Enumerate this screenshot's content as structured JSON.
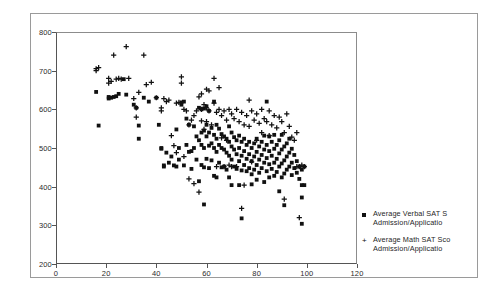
{
  "chart_data": {
    "type": "scatter",
    "title": "",
    "xlabel": "",
    "ylabel": "",
    "xlim": [
      0,
      120
    ],
    "ylim": [
      200,
      800
    ],
    "xticks": [
      0,
      20,
      40,
      60,
      80,
      100,
      120
    ],
    "yticks": [
      200,
      300,
      400,
      500,
      600,
      700,
      800
    ],
    "grid": false,
    "legend_position": "right",
    "series": [
      {
        "name": "Average Verbal SAT S Admission/Applicatio",
        "marker": "filled-square",
        "color": "#111111",
        "points": [
          [
            16,
            645
          ],
          [
            17,
            558
          ],
          [
            21,
            628
          ],
          [
            21,
            632
          ],
          [
            22,
            630
          ],
          [
            23,
            632
          ],
          [
            24,
            634
          ],
          [
            25,
            640
          ],
          [
            27,
            678
          ],
          [
            28,
            638
          ],
          [
            31,
            612
          ],
          [
            32,
            604
          ],
          [
            33,
            558
          ],
          [
            33,
            524
          ],
          [
            35,
            630
          ],
          [
            37,
            620
          ],
          [
            40,
            630
          ],
          [
            41,
            560
          ],
          [
            42,
            500
          ],
          [
            42,
            498
          ],
          [
            43,
            455
          ],
          [
            43,
            452
          ],
          [
            44,
            488
          ],
          [
            45,
            462
          ],
          [
            46,
            478
          ],
          [
            47,
            455
          ],
          [
            48,
            548
          ],
          [
            48,
            452
          ],
          [
            49,
            500
          ],
          [
            49,
            470
          ],
          [
            50,
            618
          ],
          [
            50,
            612
          ],
          [
            51,
            620
          ],
          [
            51,
            455
          ],
          [
            52,
            576
          ],
          [
            52,
            508
          ],
          [
            53,
            560
          ],
          [
            53,
            490
          ],
          [
            54,
            492
          ],
          [
            54,
            446
          ],
          [
            55,
            556
          ],
          [
            55,
            500
          ],
          [
            56,
            530
          ],
          [
            56,
            470
          ],
          [
            57,
            604
          ],
          [
            57,
            520
          ],
          [
            57,
            414
          ],
          [
            58,
            600
          ],
          [
            58,
            540
          ],
          [
            58,
            508
          ],
          [
            58,
            456
          ],
          [
            59,
            602
          ],
          [
            59,
            545
          ],
          [
            59,
            500
          ],
          [
            59,
            450
          ],
          [
            59,
            354
          ],
          [
            60,
            608
          ],
          [
            60,
            560
          ],
          [
            60,
            530
          ],
          [
            60,
            472
          ],
          [
            61,
            596
          ],
          [
            61,
            540
          ],
          [
            61,
            506
          ],
          [
            61,
            448
          ],
          [
            62,
            552
          ],
          [
            62,
            512
          ],
          [
            62,
            468
          ],
          [
            63,
            620
          ],
          [
            63,
            534
          ],
          [
            63,
            500
          ],
          [
            63,
            428
          ],
          [
            64,
            560
          ],
          [
            64,
            524
          ],
          [
            64,
            490
          ],
          [
            64,
            424
          ],
          [
            65,
            550
          ],
          [
            65,
            508
          ],
          [
            65,
            462
          ],
          [
            66,
            536
          ],
          [
            66,
            500
          ],
          [
            66,
            450
          ],
          [
            67,
            530
          ],
          [
            67,
            496
          ],
          [
            67,
            452
          ],
          [
            68,
            524
          ],
          [
            68,
            488
          ],
          [
            68,
            444
          ],
          [
            69,
            556
          ],
          [
            69,
            516
          ],
          [
            69,
            480
          ],
          [
            69,
            424
          ],
          [
            70,
            540
          ],
          [
            70,
            504
          ],
          [
            70,
            470
          ],
          [
            70,
            404
          ],
          [
            71,
            528
          ],
          [
            71,
            496
          ],
          [
            71,
            452
          ],
          [
            72,
            520
          ],
          [
            72,
            484
          ],
          [
            72,
            446
          ],
          [
            73,
            532
          ],
          [
            73,
            500
          ],
          [
            73,
            466
          ],
          [
            73,
            404
          ],
          [
            74,
            516
          ],
          [
            74,
            480
          ],
          [
            74,
            442
          ],
          [
            74,
            318
          ],
          [
            75,
            524
          ],
          [
            75,
            492
          ],
          [
            75,
            456
          ],
          [
            76,
            508
          ],
          [
            76,
            472
          ],
          [
            76,
            440
          ],
          [
            77,
            516
          ],
          [
            77,
            484
          ],
          [
            77,
            448
          ],
          [
            78,
            500
          ],
          [
            78,
            466
          ],
          [
            78,
            432
          ],
          [
            78,
            406
          ],
          [
            79,
            512
          ],
          [
            79,
            478
          ],
          [
            79,
            444
          ],
          [
            80,
            524
          ],
          [
            80,
            490
          ],
          [
            80,
            456
          ],
          [
            80,
            418
          ],
          [
            81,
            504
          ],
          [
            81,
            470
          ],
          [
            81,
            436
          ],
          [
            82,
            516
          ],
          [
            82,
            482
          ],
          [
            82,
            448
          ],
          [
            83,
            532
          ],
          [
            83,
            496
          ],
          [
            83,
            462
          ],
          [
            83,
            412
          ],
          [
            84,
            620
          ],
          [
            84,
            508
          ],
          [
            84,
            474
          ],
          [
            84,
            440
          ],
          [
            85,
            530
          ],
          [
            85,
            492
          ],
          [
            85,
            458
          ],
          [
            85,
            424
          ],
          [
            86,
            516
          ],
          [
            86,
            480
          ],
          [
            86,
            446
          ],
          [
            87,
            534
          ],
          [
            87,
            498
          ],
          [
            87,
            462
          ],
          [
            87,
            428
          ],
          [
            88,
            508
          ],
          [
            88,
            472
          ],
          [
            88,
            438
          ],
          [
            89,
            520
          ],
          [
            89,
            486
          ],
          [
            89,
            452
          ],
          [
            89,
            388
          ],
          [
            90,
            534
          ],
          [
            90,
            496
          ],
          [
            90,
            460
          ],
          [
            90,
            424
          ],
          [
            91,
            504
          ],
          [
            91,
            468
          ],
          [
            91,
            434
          ],
          [
            91,
            352
          ],
          [
            92,
            512
          ],
          [
            92,
            478
          ],
          [
            92,
            444
          ],
          [
            93,
            524
          ],
          [
            93,
            488
          ],
          [
            93,
            452
          ],
          [
            94,
            498
          ],
          [
            94,
            462
          ],
          [
            94,
            430
          ],
          [
            95,
            482
          ],
          [
            95,
            448
          ],
          [
            96,
            466
          ],
          [
            96,
            436
          ],
          [
            97,
            452
          ],
          [
            97,
            420
          ],
          [
            98,
            444
          ],
          [
            98,
            404
          ],
          [
            98,
            372
          ],
          [
            98,
            304
          ],
          [
            99,
            452
          ],
          [
            99,
            404
          ]
        ]
      },
      {
        "name": "Average Math SAT Sco Admission/Applicatio",
        "marker": "plus",
        "color": "#111111",
        "points": [
          [
            16,
            705
          ],
          [
            16,
            700
          ],
          [
            17,
            708
          ],
          [
            21,
            680
          ],
          [
            21,
            668
          ],
          [
            22,
            672
          ],
          [
            23,
            740
          ],
          [
            24,
            678
          ],
          [
            25,
            680
          ],
          [
            26,
            678
          ],
          [
            28,
            762
          ],
          [
            29,
            680
          ],
          [
            31,
            628
          ],
          [
            32,
            604
          ],
          [
            32,
            580
          ],
          [
            33,
            644
          ],
          [
            35,
            740
          ],
          [
            36,
            664
          ],
          [
            38,
            670
          ],
          [
            40,
            630
          ],
          [
            42,
            604
          ],
          [
            42,
            596
          ],
          [
            43,
            628
          ],
          [
            44,
            620
          ],
          [
            45,
            624
          ],
          [
            46,
            532
          ],
          [
            47,
            506
          ],
          [
            48,
            616
          ],
          [
            48,
            488
          ],
          [
            49,
            618
          ],
          [
            50,
            684
          ],
          [
            50,
            668
          ],
          [
            51,
            600
          ],
          [
            51,
            478
          ],
          [
            52,
            596
          ],
          [
            53,
            560
          ],
          [
            53,
            420
          ],
          [
            54,
            572
          ],
          [
            55,
            584
          ],
          [
            55,
            408
          ],
          [
            56,
            596
          ],
          [
            57,
            632
          ],
          [
            57,
            386
          ],
          [
            58,
            640
          ],
          [
            58,
            600
          ],
          [
            58,
            570
          ],
          [
            59,
            612
          ],
          [
            59,
            548
          ],
          [
            60,
            652
          ],
          [
            60,
            604
          ],
          [
            60,
            568
          ],
          [
            61,
            648
          ],
          [
            61,
            596
          ],
          [
            62,
            560
          ],
          [
            63,
            680
          ],
          [
            63,
            616
          ],
          [
            64,
            592
          ],
          [
            64,
            452
          ],
          [
            65,
            656
          ],
          [
            65,
            600
          ],
          [
            66,
            584
          ],
          [
            66,
            526
          ],
          [
            67,
            596
          ],
          [
            67,
            452
          ],
          [
            68,
            572
          ],
          [
            68,
            520
          ],
          [
            69,
            600
          ],
          [
            69,
            456
          ],
          [
            70,
            588
          ],
          [
            70,
            452
          ],
          [
            71,
            576
          ],
          [
            72,
            600
          ],
          [
            72,
            452
          ],
          [
            73,
            568
          ],
          [
            74,
            592
          ],
          [
            74,
            344
          ],
          [
            75,
            560
          ],
          [
            75,
            404
          ],
          [
            76,
            584
          ],
          [
            77,
            624
          ],
          [
            77,
            556
          ],
          [
            78,
            596
          ],
          [
            78,
            464
          ],
          [
            79,
            572
          ],
          [
            80,
            588
          ],
          [
            80,
            520
          ],
          [
            81,
            564
          ],
          [
            82,
            600
          ],
          [
            82,
            540
          ],
          [
            83,
            576
          ],
          [
            84,
            568
          ],
          [
            85,
            596
          ],
          [
            85,
            532
          ],
          [
            86,
            560
          ],
          [
            87,
            584
          ],
          [
            88,
            552
          ],
          [
            89,
            580
          ],
          [
            90,
            568
          ],
          [
            91,
            540
          ],
          [
            91,
            368
          ],
          [
            92,
            588
          ],
          [
            93,
            556
          ],
          [
            94,
            528
          ],
          [
            95,
            520
          ],
          [
            96,
            540
          ],
          [
            96,
            452
          ],
          [
            97,
            452
          ],
          [
            97,
            320
          ],
          [
            98,
            456
          ],
          [
            99,
            452
          ]
        ]
      }
    ]
  },
  "legend": {
    "entries": [
      {
        "marker_glyph": "square",
        "line1": "Average Verbal SAT S",
        "line2": "Admission/Applicatio"
      },
      {
        "marker_glyph": "plus",
        "line1": "Average Math SAT Sco",
        "line2": "Admission/Applicatio"
      }
    ],
    "plus_glyph": "+"
  }
}
